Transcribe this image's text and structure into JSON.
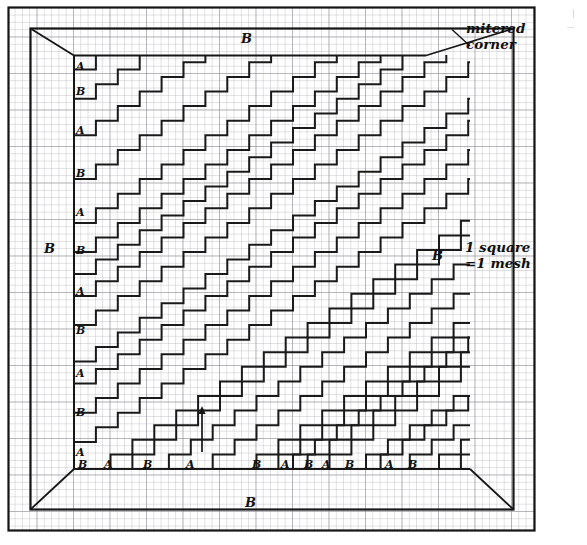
{
  "figure": {
    "kind": "needlepoint-chart",
    "note_mitered": "mitered\ncorner",
    "note_mitered_line1": "mitered",
    "note_mitered_line2": "corner",
    "note_scale_line1": "1 square",
    "note_scale_line2": "=1 mesh",
    "scale_note_full": "1 square =1 mesh",
    "arrow_label": "up-arrow",
    "colors": {
      "ink": "#121212",
      "grid_minor": "#b9b9bd",
      "grid_major": "#8e8e94",
      "paper": "#ffffff",
      "stair": "#1a1a1a"
    }
  },
  "edge_labels": {
    "top": "B",
    "bottom": "B",
    "left": "B",
    "right": "B"
  },
  "left_column_labels": [
    "A",
    "B",
    "A",
    "B",
    "A",
    "B",
    "A",
    "B",
    "A",
    "B",
    "A"
  ],
  "bottom_row_labels": [
    "B",
    "A",
    "B",
    "A",
    "B",
    "A",
    "B",
    "A",
    "B",
    "A",
    "B"
  ],
  "chart_data": {
    "type": "heatmap",
    "title": "",
    "xlabel": "",
    "ylabel": "",
    "grid": true,
    "legend_position": "right",
    "annotations": [
      "mitered corner",
      "1 square =1 mesh",
      "B (top border band)",
      "B (bottom border band)",
      "B (left border band)",
      "B (right border band)"
    ],
    "mesh": {
      "square_px": 7.3,
      "cols": 72,
      "rows": 72,
      "unit": "1 square = 1 mesh"
    },
    "bands": {
      "sequence_left_top_to_bottom": [
        "A",
        "B",
        "A",
        "B",
        "A",
        "B",
        "A",
        "B",
        "A",
        "B",
        "A"
      ],
      "sequence_bottom_left_to_right": [
        "B",
        "A",
        "B",
        "A",
        "B",
        "A",
        "B",
        "A",
        "B",
        "A",
        "B"
      ],
      "band_widths_bottom": [
        2,
        3,
        5,
        6,
        6,
        3,
        2,
        2,
        3,
        5,
        2
      ]
    },
    "stair": {
      "run": 3,
      "rise": 2,
      "line_count": 12,
      "direction": "diagonal up-right"
    }
  },
  "geometry": {
    "outer_frame": {
      "x": 8,
      "y": 7,
      "w": 527,
      "h": 524
    },
    "inner_rect": {
      "x": 30,
      "y": 28,
      "w": 483,
      "h": 482
    },
    "pattern_rect": {
      "x": 74,
      "y": 55,
      "w": 352,
      "h": 414
    },
    "arrow": {
      "x": 202,
      "y1": 452,
      "y2": 407
    }
  }
}
